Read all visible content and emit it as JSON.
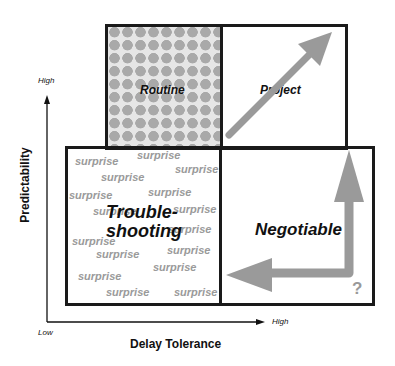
{
  "diagram": {
    "quadrants": {
      "top_left": {
        "label": "Routine",
        "pattern": "hearts"
      },
      "top_right": {
        "label": "Project",
        "arrow": "diagonal-up-right"
      },
      "bottom_left": {
        "label_line1": "Trouble-",
        "label_line2": "shooting",
        "scatter_word": "surprise"
      },
      "bottom_right": {
        "label": "Negotiable",
        "arrows": [
          "up",
          "left"
        ],
        "mark": "?"
      }
    },
    "axes": {
      "y": {
        "label": "Predictability",
        "high": "High",
        "low": "Low"
      },
      "x": {
        "label": "Delay Tolerance",
        "high": "High"
      }
    },
    "surprise_words": [
      "surprise",
      "surprise",
      "surprise",
      "surprise",
      "surprise",
      "surprise",
      "surprise",
      "surprise",
      "surprise",
      "surprise",
      "surprise",
      "surprise",
      "surprise",
      "surprise",
      "surprise",
      "surprise"
    ],
    "colors": {
      "border": "#1a1a1a",
      "arrow": "#9a9a9a",
      "surprise_text": "#9a9a9a",
      "hearts": "#a9a9a9"
    }
  }
}
